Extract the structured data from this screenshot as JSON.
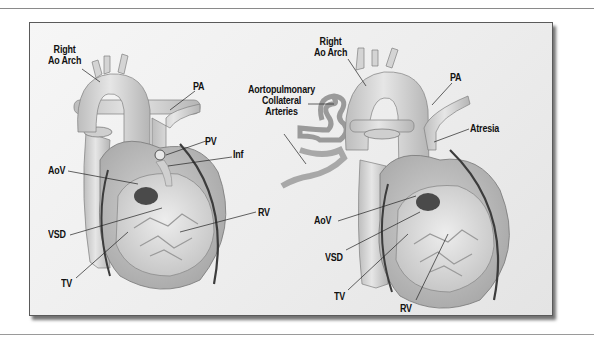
{
  "figure": {
    "left_panel": {
      "labels": {
        "right_ao_arch": [
          "Right",
          "Ao Arch"
        ],
        "pa": "PA",
        "pv": "PV",
        "inf": "Inf",
        "aov": "AoV",
        "vsd": "VSD",
        "rv": "RV",
        "tv": "TV"
      }
    },
    "right_panel": {
      "labels": {
        "right_ao_arch": [
          "Right",
          "Ao Arch"
        ],
        "aortopulmonary_collateral_arteries": [
          "Aortopulmonary",
          "Collateral",
          "Arteries"
        ],
        "pa": "PA",
        "atresia": "Atresia",
        "aov": "AoV",
        "vsd": "VSD",
        "tv": "TV",
        "rv": "RV"
      }
    },
    "colors": {
      "frame_border": "#5a5a5a",
      "background": "#efefef",
      "vessel_fill": "#d6d6d6",
      "vessel_stroke": "#7a7a7a",
      "coronary": "#3c3c3c",
      "label_text": "#111111"
    }
  }
}
